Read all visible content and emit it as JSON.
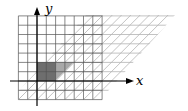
{
  "diagram": {
    "type": "shear-transformation-grid",
    "axes": {
      "x_label": "x",
      "y_label": "y"
    },
    "original_grid": {
      "x_range": [
        -2,
        7
      ],
      "y_range": [
        -2,
        7
      ],
      "color": "#555555"
    },
    "sheared_grid": {
      "description": "grid sheared horizontally",
      "color": "#b0b0b0"
    },
    "shaded_square": {
      "corners": [
        [
          0,
          0
        ],
        [
          2,
          0
        ],
        [
          2,
          2
        ],
        [
          0,
          2
        ]
      ],
      "color": "#6e6e6e"
    },
    "shaded_sheared": {
      "corners": [
        [
          0,
          0
        ],
        [
          2,
          0
        ],
        [
          4,
          2
        ],
        [
          2,
          2
        ]
      ],
      "color": "#a8a8a8"
    }
  }
}
